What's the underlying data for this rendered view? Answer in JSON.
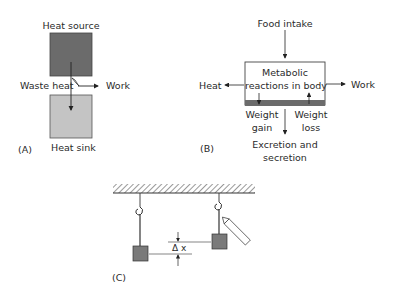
{
  "panelA": {
    "tag": "(A)",
    "top_label": "Heat source",
    "bottom_label": "Heat sink",
    "left_label": "Waste heat",
    "right_label": "Work",
    "colors": {
      "source": "#6b6b6b",
      "sink": "#c4c4c4"
    }
  },
  "panelB": {
    "tag": "(B)",
    "top_label": "Food intake",
    "box_line1": "Metabolic",
    "box_line2": "reactions in body",
    "left_label": "Heat",
    "right_label": "Work",
    "gain_line1": "Weight",
    "gain_line2": "gain",
    "loss_line1": "Weight",
    "loss_line2": "loss",
    "bottom_line1": "Excretion and",
    "bottom_line2": "secretion",
    "colors": {
      "band": "#6b6b6b"
    }
  },
  "panelC": {
    "tag": "(C)",
    "delta_label": "Δ x",
    "colors": {
      "mass": "#7a7a7a"
    }
  }
}
